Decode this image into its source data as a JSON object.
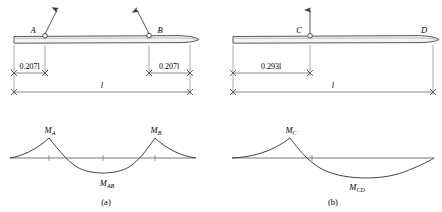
{
  "figure": {
    "panels": [
      {
        "caption": "(a)",
        "beam": {
          "supports": [
            {
              "label": "A",
              "position_fraction": 0.207,
              "load_arrow": "up-right"
            },
            {
              "label": "B",
              "position_fraction": 0.793,
              "load_arrow": "up-left"
            }
          ],
          "dimensions": [
            {
              "text": "0.207l",
              "value": "0.207",
              "symbol": "l"
            },
            {
              "text": "0.207l",
              "value": "0.207",
              "symbol": "l"
            },
            {
              "text": "l",
              "value": "",
              "symbol": "l"
            }
          ]
        },
        "moment_diagram": {
          "labels": [
            {
              "text": "MA",
              "base": "M",
              "sub": "A"
            },
            {
              "text": "MB",
              "base": "M",
              "sub": "B"
            },
            {
              "text": "MAB",
              "base": "M",
              "sub": "AB"
            }
          ]
        }
      },
      {
        "caption": "(b)",
        "beam": {
          "supports": [
            {
              "label": "C",
              "position_fraction": 0.293,
              "load_arrow": "up"
            },
            {
              "label": "D",
              "position_fraction": 1.0,
              "load_arrow": "none"
            }
          ],
          "dimensions": [
            {
              "text": "0.293l",
              "value": "0.293",
              "symbol": "l"
            },
            {
              "text": "l",
              "value": "",
              "symbol": "l"
            }
          ]
        },
        "moment_diagram": {
          "labels": [
            {
              "text": "MC",
              "base": "M",
              "sub": "C"
            },
            {
              "text": "MCD",
              "base": "M",
              "sub": "CD"
            }
          ]
        }
      }
    ],
    "colors": {
      "line": "#3a3a3a",
      "beam_fill": "#f2f2f2",
      "dimension": "#555555",
      "background": "#ffffff"
    }
  }
}
